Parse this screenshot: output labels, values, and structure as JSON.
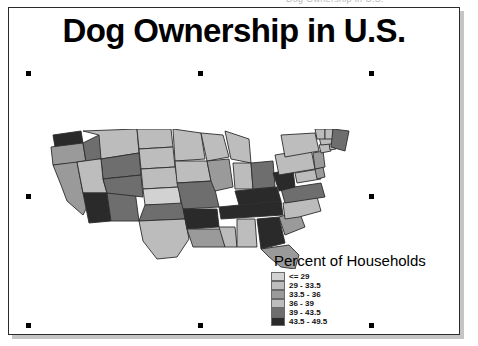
{
  "window": {
    "clipped_top_text": "Dog Ownership in U.S."
  },
  "map_title": "Dog Ownership in U.S.",
  "legend": {
    "title": "Percent of Households",
    "classes": [
      {
        "label": "<= 29",
        "color": "#d2d2d2",
        "min": null,
        "max": 29
      },
      {
        "label": "29 - 33.5",
        "color": "#bdbdbd",
        "min": 29,
        "max": 33.5
      },
      {
        "label": "33.5 - 36",
        "color": "#9a9a9a",
        "min": 33.5,
        "max": 36
      },
      {
        "label": "36 - 39",
        "color": "#bcbcbc",
        "min": 36,
        "max": 39
      },
      {
        "label": "39 - 43.5",
        "color": "#6e6e6e",
        "min": 39,
        "max": 43.5
      },
      {
        "label": "43.5 - 49.5",
        "color": "#2a2a2a",
        "min": 43.5,
        "max": 49.5
      }
    ]
  },
  "chart_data": {
    "type": "heatmap",
    "title": "Dog Ownership in U.S.",
    "subtitle": "",
    "xlabel": "",
    "ylabel": "",
    "legend_title": "Percent of Households",
    "legend_position": "bottom-right",
    "grid": false,
    "value_unit": "percent of households",
    "value_range": [
      29,
      49.5
    ],
    "bins": [
      "<= 29",
      "29 - 33.5",
      "33.5 - 36",
      "36 - 39",
      "39 - 43.5",
      "43.5 - 49.5"
    ],
    "bin_colors": [
      "#d2d2d2",
      "#bdbdbd",
      "#9a9a9a",
      "#bcbcbc",
      "#6e6e6e",
      "#2a2a2a"
    ],
    "regions": [
      {
        "name": "Washington",
        "bin": "43.5 - 49.5"
      },
      {
        "name": "Oregon",
        "bin": "33.5 - 36"
      },
      {
        "name": "Idaho",
        "bin": "39 - 43.5"
      },
      {
        "name": "Montana",
        "bin": "36 - 39"
      },
      {
        "name": "Wyoming",
        "bin": "39 - 43.5"
      },
      {
        "name": "North Dakota",
        "bin": "36 - 39"
      },
      {
        "name": "South Dakota",
        "bin": "29 - 33.5"
      },
      {
        "name": "Nebraska",
        "bin": "29 - 33.5"
      },
      {
        "name": "Minnesota",
        "bin": "29 - 33.5"
      },
      {
        "name": "Iowa",
        "bin": "29 - 33.5"
      },
      {
        "name": "Wisconsin",
        "bin": "29 - 33.5"
      },
      {
        "name": "Michigan",
        "bin": "29 - 33.5"
      },
      {
        "name": "California",
        "bin": "33.5 - 36"
      },
      {
        "name": "Nevada",
        "bin": "43.5 - 49.5"
      },
      {
        "name": "Utah",
        "bin": "29 - 33.5"
      },
      {
        "name": "Colorado",
        "bin": "39 - 43.5"
      },
      {
        "name": "Arizona",
        "bin": "43.5 - 49.5"
      },
      {
        "name": "New Mexico",
        "bin": "39 - 43.5"
      },
      {
        "name": "Kansas",
        "bin": "<= 29"
      },
      {
        "name": "Oklahoma",
        "bin": "39 - 43.5"
      },
      {
        "name": "Texas",
        "bin": "36 - 39"
      },
      {
        "name": "Missouri",
        "bin": "39 - 43.5"
      },
      {
        "name": "Arkansas",
        "bin": "43.5 - 49.5"
      },
      {
        "name": "Louisiana",
        "bin": "33.5 - 36"
      },
      {
        "name": "Mississippi",
        "bin": "36 - 39"
      },
      {
        "name": "Alabama",
        "bin": "29 - 33.5"
      },
      {
        "name": "Tennessee",
        "bin": "43.5 - 49.5"
      },
      {
        "name": "Kentucky",
        "bin": "43.5 - 49.5"
      },
      {
        "name": "Illinois",
        "bin": "33.5 - 36"
      },
      {
        "name": "Indiana",
        "bin": "36 - 39"
      },
      {
        "name": "Ohio",
        "bin": "39 - 43.5"
      },
      {
        "name": "West Virginia",
        "bin": "43.5 - 49.5"
      },
      {
        "name": "Virginia",
        "bin": "39 - 43.5"
      },
      {
        "name": "North Carolina",
        "bin": "36 - 39"
      },
      {
        "name": "South Carolina",
        "bin": "33.5 - 36"
      },
      {
        "name": "Georgia",
        "bin": "43.5 - 49.5"
      },
      {
        "name": "Florida",
        "bin": "33.5 - 36"
      },
      {
        "name": "Pennsylvania",
        "bin": "36 - 39"
      },
      {
        "name": "New York",
        "bin": "29 - 33.5"
      },
      {
        "name": "Maryland",
        "bin": "36 - 39"
      },
      {
        "name": "Delaware",
        "bin": "33.5 - 36"
      },
      {
        "name": "New Jersey",
        "bin": "33.5 - 36"
      },
      {
        "name": "Connecticut",
        "bin": "29 - 33.5"
      },
      {
        "name": "Rhode Island",
        "bin": "29 - 33.5"
      },
      {
        "name": "Massachusetts",
        "bin": "29 - 33.5"
      },
      {
        "name": "Vermont",
        "bin": "36 - 39"
      },
      {
        "name": "New Hampshire",
        "bin": "29 - 33.5"
      },
      {
        "name": "Maine",
        "bin": "39 - 43.5"
      }
    ]
  },
  "selection": {
    "handle_color": "#000000",
    "handles": [
      {
        "name": "handle-top-left",
        "x": 26,
        "y": 71
      },
      {
        "name": "handle-top-center",
        "x": 198,
        "y": 71
      },
      {
        "name": "handle-top-right",
        "x": 369,
        "y": 71
      },
      {
        "name": "handle-middle-left",
        "x": 26,
        "y": 194
      },
      {
        "name": "handle-middle-right",
        "x": 369,
        "y": 194
      },
      {
        "name": "handle-bottom-left",
        "x": 26,
        "y": 323
      },
      {
        "name": "handle-bottom-center",
        "x": 198,
        "y": 323
      },
      {
        "name": "handle-bottom-right",
        "x": 369,
        "y": 323
      }
    ]
  }
}
